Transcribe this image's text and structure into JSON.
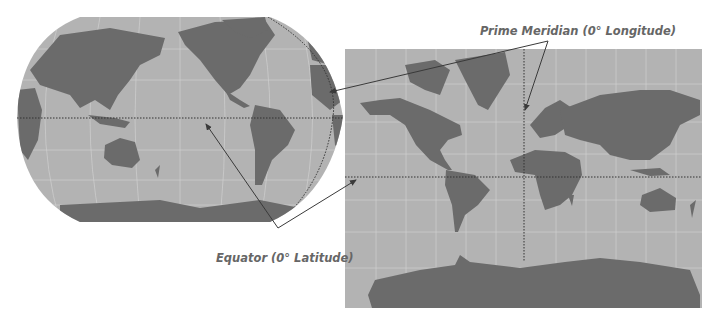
{
  "figure": {
    "left_map": {
      "projection": "Robinson (Pacific-centered)",
      "ocean_color": "#b3b3b3",
      "land_color": "#6b6b6b"
    },
    "right_map": {
      "projection": "Mercator (Atlantic-centered)",
      "ocean_color": "#b3b3b3",
      "land_color": "#6b6b6b"
    },
    "labels": {
      "prime_meridian": "Prime Meridian (0° Longitude)",
      "equator": "Equator (0° Latitude)"
    },
    "colors": {
      "text": "#666666",
      "arrow": "#3a3a3a",
      "grid": "#d0d0d0",
      "dotted_line": "#333333"
    }
  }
}
